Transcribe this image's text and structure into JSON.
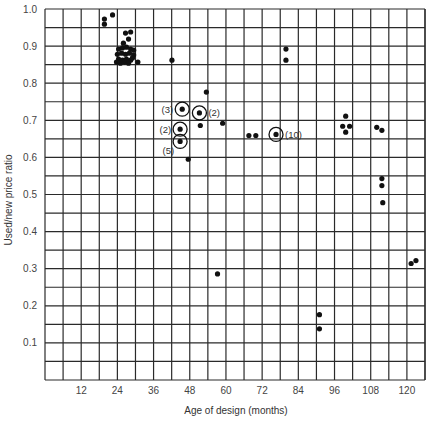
{
  "chart_data": {
    "type": "scatter",
    "title": "",
    "xlabel": "Age of design (months)",
    "ylabel": "Used/new price ratio",
    "xlim": [
      0,
      126
    ],
    "ylim": [
      0,
      1.0
    ],
    "grid": true,
    "x_ticks": [
      12,
      24,
      36,
      48,
      60,
      72,
      84,
      96,
      108,
      120
    ],
    "x_tick_labels": [
      "12",
      "24",
      "36",
      "48",
      "60",
      "72",
      "84",
      "96",
      "108",
      "120"
    ],
    "y_ticks": [
      0.1,
      0.2,
      0.3,
      0.4,
      0.5,
      0.6,
      0.7,
      0.8,
      0.9,
      1.0
    ],
    "y_tick_labels": [
      "0.1",
      "0.2",
      "0.3",
      "0.4",
      "0.5",
      "0.6",
      "0.7",
      "0.8",
      "0.9",
      "1.0"
    ],
    "x_grid_step": 6,
    "y_grid_step": 0.05,
    "points": [
      {
        "x": 19.7,
        "y": 0.973
      },
      {
        "x": 19.7,
        "y": 0.959
      },
      {
        "x": 22.4,
        "y": 0.984
      },
      {
        "x": 26.7,
        "y": 0.935
      },
      {
        "x": 28.4,
        "y": 0.938
      },
      {
        "x": 27.7,
        "y": 0.919
      },
      {
        "x": 26.0,
        "y": 0.908
      },
      {
        "x": 24.4,
        "y": 0.892
      },
      {
        "x": 25.7,
        "y": 0.895
      },
      {
        "x": 27.0,
        "y": 0.897
      },
      {
        "x": 28.4,
        "y": 0.892
      },
      {
        "x": 29.4,
        "y": 0.889
      },
      {
        "x": 24.0,
        "y": 0.878
      },
      {
        "x": 25.4,
        "y": 0.881
      },
      {
        "x": 26.7,
        "y": 0.878
      },
      {
        "x": 28.0,
        "y": 0.881
      },
      {
        "x": 29.4,
        "y": 0.876
      },
      {
        "x": 24.4,
        "y": 0.865
      },
      {
        "x": 25.7,
        "y": 0.862
      },
      {
        "x": 27.0,
        "y": 0.865
      },
      {
        "x": 28.4,
        "y": 0.862
      },
      {
        "x": 29.0,
        "y": 0.868
      },
      {
        "x": 23.7,
        "y": 0.857
      },
      {
        "x": 25.0,
        "y": 0.854
      },
      {
        "x": 26.4,
        "y": 0.857
      },
      {
        "x": 27.7,
        "y": 0.854
      },
      {
        "x": 30.8,
        "y": 0.857
      },
      {
        "x": 42.1,
        "y": 0.862
      },
      {
        "x": 53.5,
        "y": 0.776
      },
      {
        "x": 51.5,
        "y": 0.686
      },
      {
        "x": 58.9,
        "y": 0.692
      },
      {
        "x": 47.5,
        "y": 0.595
      },
      {
        "x": 79.9,
        "y": 0.892
      },
      {
        "x": 79.9,
        "y": 0.862
      },
      {
        "x": 67.6,
        "y": 0.659
      },
      {
        "x": 69.9,
        "y": 0.659
      },
      {
        "x": 99.7,
        "y": 0.711
      },
      {
        "x": 98.7,
        "y": 0.684
      },
      {
        "x": 101.0,
        "y": 0.684
      },
      {
        "x": 99.7,
        "y": 0.668
      },
      {
        "x": 110.0,
        "y": 0.681
      },
      {
        "x": 111.7,
        "y": 0.673
      },
      {
        "x": 111.7,
        "y": 0.543
      },
      {
        "x": 111.7,
        "y": 0.524
      },
      {
        "x": 112.0,
        "y": 0.478
      },
      {
        "x": 57.2,
        "y": 0.286
      },
      {
        "x": 91.0,
        "y": 0.176
      },
      {
        "x": 91.0,
        "y": 0.138
      },
      {
        "x": 121.4,
        "y": 0.314
      },
      {
        "x": 123.0,
        "y": 0.322
      }
    ],
    "circled_points": [
      {
        "x": 45.5,
        "y": 0.73,
        "count": 3,
        "label": "(3)",
        "label_side": "left"
      },
      {
        "x": 51.2,
        "y": 0.72,
        "count": 2,
        "label": "(2)",
        "label_side": "right"
      },
      {
        "x": 44.8,
        "y": 0.676,
        "count": 2,
        "label": "(2)",
        "label_side": "left"
      },
      {
        "x": 44.8,
        "y": 0.643,
        "count": 5,
        "label": "(5)",
        "label_side": "below-left"
      },
      {
        "x": 76.6,
        "y": 0.662,
        "count": 10,
        "label": "(10)",
        "label_side": "right"
      }
    ]
  }
}
